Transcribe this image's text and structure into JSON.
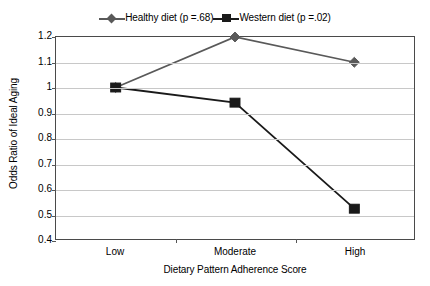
{
  "chart_data": {
    "type": "line",
    "title": "",
    "xlabel": "Dietary Pattern Adherence Score",
    "ylabel": "Odds Ratio of Ideal Aging",
    "categories": [
      "Low",
      "Moderate",
      "High"
    ],
    "ylim": [
      0.4,
      1.2
    ],
    "yticks": [
      "1.2",
      "1.1",
      "1",
      "0.9",
      "0.8",
      "0.7",
      "0.6",
      "0.5",
      "0.4"
    ],
    "ytick_values": [
      1.2,
      1.1,
      1.0,
      0.9,
      0.8,
      0.7,
      0.6,
      0.5,
      0.4
    ],
    "grid": true,
    "legend_position": "top-center",
    "series": [
      {
        "name": "Healthy diet (p =.68)",
        "values": [
          1.0,
          1.2,
          1.1
        ],
        "marker": "diamond",
        "color": "#595959",
        "p_value": ".68"
      },
      {
        "name": "Western diet (p =.02)",
        "values": [
          1.0,
          0.94,
          0.52
        ],
        "marker": "square",
        "color": "#1a1a1a",
        "p_value": ".02"
      }
    ]
  },
  "legend": {
    "entries": [
      {
        "label": "Healthy diet (p =.68)"
      },
      {
        "label": "Western diet (p =.02)"
      }
    ]
  },
  "axes": {
    "y_title": "Odds Ratio of Ideal Aging",
    "x_title": "Dietary Pattern Adherence Score"
  },
  "colors": {
    "healthy_series": "#595959",
    "western_series": "#1a1a1a",
    "gridline": "#c8c8c8",
    "plot_border": "#4a4a4a",
    "background": "#ffffff",
    "text": "#000000"
  }
}
